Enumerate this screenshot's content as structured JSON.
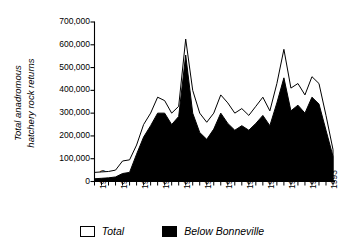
{
  "chart_data": {
    "type": "area",
    "title": "",
    "xlabel": "",
    "ylabel": "Total anadromous hatchery rock returns",
    "ylabel_line1": "Total anadromous",
    "ylabel_line2": "hatchery rock returns",
    "xlim": [
      1960,
      1994
    ],
    "ylim": [
      0,
      700000
    ],
    "ytick_values": [
      0,
      100000,
      200000,
      300000,
      400000,
      500000,
      600000,
      700000
    ],
    "ytick_labels": [
      "0",
      "100,000",
      "200,000",
      "300,000",
      "400,000",
      "500,000",
      "600,000",
      "700,000"
    ],
    "xtick_labels": [
      "1960",
      "1963",
      "1966",
      "1969",
      "1972",
      "1975",
      "1978",
      "1981",
      "1984",
      "1987",
      "1990",
      "1993"
    ],
    "xtick_values": [
      1960,
      1963,
      1966,
      1969,
      1972,
      1975,
      1978,
      1981,
      1984,
      1987,
      1990,
      1993
    ],
    "minor_xticks_every": 1,
    "grid": false,
    "legend_position": "bottom",
    "x": [
      1960,
      1961,
      1962,
      1963,
      1964,
      1965,
      1966,
      1967,
      1968,
      1969,
      1970,
      1971,
      1972,
      1973,
      1974,
      1975,
      1976,
      1977,
      1978,
      1979,
      1980,
      1981,
      1982,
      1983,
      1984,
      1985,
      1986,
      1987,
      1988,
      1989,
      1990,
      1991,
      1992,
      1993,
      1994
    ],
    "series": [
      {
        "name": "Total",
        "color": "#ffffff",
        "edge_color": "#000000",
        "values": [
          40000,
          42000,
          44000,
          50000,
          90000,
          95000,
          160000,
          250000,
          300000,
          370000,
          355000,
          300000,
          330000,
          625000,
          400000,
          300000,
          260000,
          300000,
          380000,
          345000,
          300000,
          320000,
          290000,
          330000,
          370000,
          310000,
          430000,
          580000,
          410000,
          430000,
          380000,
          460000,
          430000,
          290000,
          140000
        ]
      },
      {
        "name": "Below Bonneville",
        "color": "#000000",
        "edge_color": "#000000",
        "values": [
          12000,
          14000,
          16000,
          20000,
          35000,
          40000,
          120000,
          195000,
          245000,
          300000,
          300000,
          250000,
          285000,
          555000,
          300000,
          215000,
          185000,
          230000,
          300000,
          255000,
          225000,
          245000,
          225000,
          255000,
          290000,
          245000,
          345000,
          455000,
          310000,
          335000,
          300000,
          370000,
          340000,
          225000,
          110000
        ]
      }
    ]
  },
  "legend": {
    "entries": [
      {
        "label": "Total",
        "swatch": "white-square-icon"
      },
      {
        "label": "Below Bonneville",
        "swatch": "black-square-icon"
      }
    ]
  }
}
